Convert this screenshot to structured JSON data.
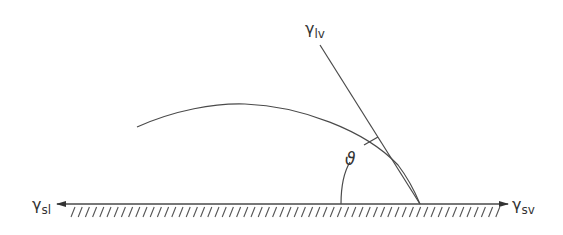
{
  "diagram": {
    "type": "contact-angle",
    "colors": {
      "stroke": "#4a4a4a",
      "text": "#333333",
      "background": "#ffffff"
    },
    "labels": {
      "gamma_lv": {
        "main": "γ",
        "sub": "lv"
      },
      "gamma_sl": {
        "main": "γ",
        "sub": "sl"
      },
      "gamma_sv": {
        "main": "γ",
        "sub": "sv"
      },
      "theta": "ϑ"
    }
  }
}
